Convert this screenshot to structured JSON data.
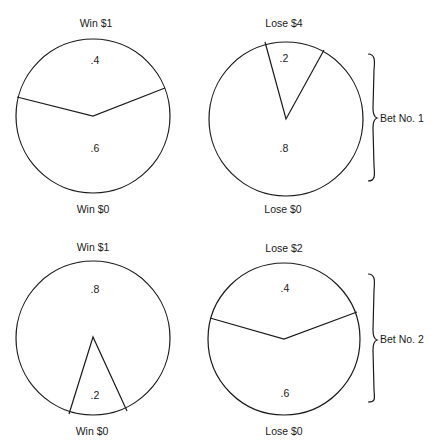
{
  "bets": [
    {
      "label": "Bet No. 1",
      "win_wheel": {
        "top_label": "Win $1",
        "bottom_label": "Win $0",
        "top_prob": ".4",
        "bottom_prob": ".6"
      },
      "lose_wheel": {
        "top_label": "Lose $4",
        "bottom_label": "Lose $0",
        "top_prob": ".2",
        "bottom_prob": ".8"
      }
    },
    {
      "label": "Bet No. 2",
      "win_wheel": {
        "top_label": "Win $1",
        "bottom_label": "Win $0",
        "top_prob": ".8",
        "bottom_prob": ".2"
      },
      "lose_wheel": {
        "top_label": "Lose $2",
        "bottom_label": "Lose $0",
        "top_prob": ".4",
        "bottom_prob": ".6"
      }
    }
  ],
  "colors": {
    "stroke": "#1a1a1a",
    "background": "#ffffff"
  }
}
